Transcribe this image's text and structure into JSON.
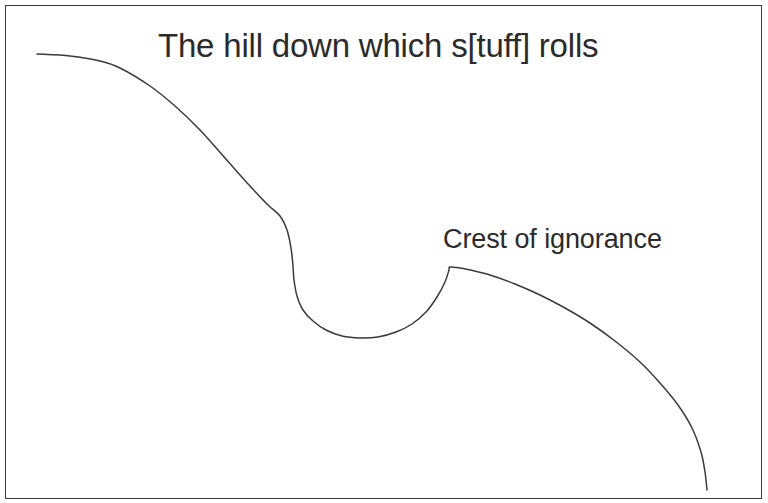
{
  "canvas": {
    "width": 768,
    "height": 503,
    "background_color": "#ffffff"
  },
  "frame": {
    "name": "outer-border",
    "color": "#3a3a3a",
    "thickness_px": 1
  },
  "labels": {
    "title": "The hill down which s[tuff] rolls",
    "annotation": "Crest of ignorance"
  },
  "chart_data": {
    "type": "line",
    "title": "The hill down which s[tuff] rolls",
    "xlabel": "",
    "ylabel": "",
    "grid": false,
    "legend": "none",
    "line_color": "#3a3a3a",
    "line_width": 1.5,
    "xlim": [
      0,
      768
    ],
    "ylim": [
      503,
      0
    ],
    "annotations": [
      {
        "text": "Crest of ignorance",
        "x": 443,
        "y": 226,
        "points_to_x": 458,
        "points_to_y": 267
      }
    ],
    "series": [
      {
        "name": "hill-curve",
        "points": [
          [
            37,
            54
          ],
          [
            70,
            56
          ],
          [
            100,
            61
          ],
          [
            120,
            68
          ],
          [
            150,
            86
          ],
          [
            175,
            106
          ],
          [
            200,
            130
          ],
          [
            225,
            158
          ],
          [
            250,
            186
          ],
          [
            268,
            205
          ],
          [
            280,
            216
          ],
          [
            287,
            230
          ],
          [
            291,
            248
          ],
          [
            293,
            266
          ],
          [
            294,
            280
          ],
          [
            297,
            296
          ],
          [
            303,
            310
          ],
          [
            313,
            321
          ],
          [
            326,
            330
          ],
          [
            342,
            336
          ],
          [
            360,
            338
          ],
          [
            378,
            337
          ],
          [
            396,
            332
          ],
          [
            412,
            324
          ],
          [
            426,
            312
          ],
          [
            437,
            297
          ],
          [
            445,
            282
          ],
          [
            449,
            270
          ],
          [
            450,
            267
          ],
          [
            460,
            268
          ],
          [
            470,
            270
          ],
          [
            490,
            275
          ],
          [
            515,
            284
          ],
          [
            540,
            295
          ],
          [
            565,
            308
          ],
          [
            590,
            323
          ],
          [
            615,
            341
          ],
          [
            640,
            362
          ],
          [
            660,
            383
          ],
          [
            678,
            405
          ],
          [
            692,
            428
          ],
          [
            701,
            452
          ],
          [
            705,
            472
          ],
          [
            707,
            490
          ]
        ]
      }
    ]
  }
}
